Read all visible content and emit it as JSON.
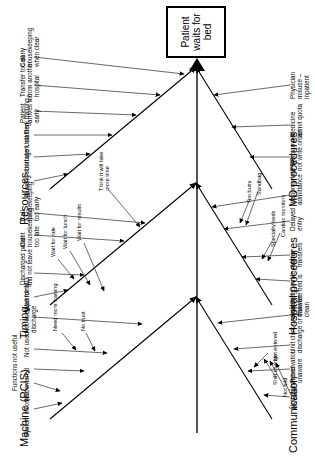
{
  "diagram": {
    "type": "fishbone-ishikawa",
    "orientation": "rotated-90-ccw",
    "effect": "Patient waits for bed",
    "colors": {
      "line": "#000000",
      "spine": "#555555",
      "background": "#ffffff"
    },
    "categories": [
      {
        "id": "machine",
        "label": "Machine (PCIS)",
        "side": "upper-left",
        "causes": [
          {
            "label": "System incorrect",
            "subcauses": []
          },
          {
            "label": "Not entered",
            "subcauses": []
          },
          {
            "label": "Functions not useful",
            "subcauses": []
          },
          {
            "label": "Not used",
            "subcauses": [
              "Need more training",
              "No trust"
            ]
          },
          {
            "label": "Not used pending discharge",
            "subcauses": []
          }
        ]
      },
      {
        "id": "timing",
        "label": "Timing",
        "side": "mid-left",
        "causes": [
          {
            "label": "Wait for MD",
            "subcauses": []
          },
          {
            "label": "Discharged patient did not leave",
            "subcauses": [
              "Wait for ride",
              "Wait for lunch",
              "Wait for results"
            ]
          },
          {
            "label": "Call housekeeping too late",
            "subcauses": []
          },
          {
            "label": "Call housekeeping too early",
            "subcauses": [
              "Think it will take more time"
            ]
          }
        ]
      },
      {
        "id": "resources",
        "label": "Resources",
        "side": "lower-left",
        "causes": [
          {
            "label": "Nursing shortage",
            "subcauses": []
          },
          {
            "label": "Unit clerk staffing",
            "subcauses": []
          },
          {
            "label": "Unit clerk training",
            "subcauses": []
          },
          {
            "label": "Patient arrives too early",
            "subcauses": []
          },
          {
            "label": "Transfer too early from another hospital",
            "subcauses": []
          },
          {
            "label": "Call housekeeping when clear",
            "subcauses": []
          }
        ]
      },
      {
        "id": "communication",
        "label": "Communication",
        "side": "upper-right",
        "causes": [
          {
            "label": "Unit switch bed",
            "subcauses": []
          },
          {
            "label": "Reservation unaware",
            "subcauses": [
              "Not entered"
            ]
          },
          {
            "label": "Unit clerk unaware of discharge or transfer",
            "subcauses": [
              "Shift change",
              "Not told",
              "On break"
            ]
          },
          {
            "label": "Admitting unaware bed is clean",
            "subcauses": []
          }
        ]
      },
      {
        "id": "hospital-procedures",
        "label": "Hospital procedures",
        "side": "mid-right",
        "causes": [
          {
            "label": "Double rooms",
            "subcauses": []
          },
          {
            "label": "Many transfers",
            "subcauses": [
              "Specialty beds",
              "Cardiac monitors"
            ]
          },
          {
            "label": "Delayed entry",
            "subcauses": [
              "Too busy",
              "Sandbag"
            ]
          },
          {
            "label": "Inappropriate ER admittance",
            "subcauses": []
          }
        ]
      },
      {
        "id": "md-procedures",
        "label": "MD procedures",
        "side": "lower-right",
        "causes": [
          {
            "label": "Physician did not write order",
            "subcauses": []
          },
          {
            "label": "Medicine admit quota",
            "subcauses": []
          },
          {
            "label": "Physician misuse – inpatient",
            "subcauses": []
          }
        ]
      }
    ]
  }
}
